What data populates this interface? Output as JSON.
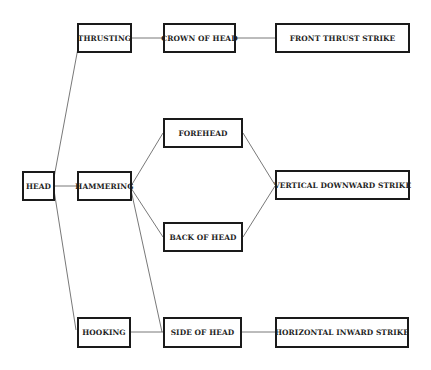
{
  "diagram": {
    "type": "tree",
    "colors": {
      "line": "#555555",
      "border": "#1a1a1a",
      "text": "#1e1e1e",
      "background": "#ffffff"
    },
    "nodes": {
      "head": {
        "label": "HEAD",
        "x": 22,
        "y": 171,
        "w": 33,
        "h": 30
      },
      "thrusting": {
        "label": "THRUSTING",
        "x": 77,
        "y": 23,
        "w": 55,
        "h": 30
      },
      "hammering": {
        "label": "HAMMERING",
        "x": 77,
        "y": 171,
        "w": 55,
        "h": 30
      },
      "hooking": {
        "label": "HOOKING",
        "x": 77,
        "y": 317,
        "w": 54,
        "h": 31
      },
      "crown": {
        "label": "CROWN OF HEAD",
        "x": 163,
        "y": 23,
        "w": 73,
        "h": 30
      },
      "forehead": {
        "label": "FOREHEAD",
        "x": 163,
        "y": 118,
        "w": 80,
        "h": 30
      },
      "back": {
        "label": "BACK OF HEAD",
        "x": 163,
        "y": 222,
        "w": 80,
        "h": 30
      },
      "side": {
        "label": "SIDE OF HEAD",
        "x": 163,
        "y": 317,
        "w": 79,
        "h": 31
      },
      "front_strike": {
        "label": "FRONT THRUST STRIKE",
        "x": 275,
        "y": 23,
        "w": 135,
        "h": 30
      },
      "vert_strike": {
        "label": "VERTICAL DOWNWARD STRIKE",
        "x": 275,
        "y": 170,
        "w": 135,
        "h": 30
      },
      "horiz_strike": {
        "label": "HORIZONTAL INWARD STRIKE",
        "x": 275,
        "y": 317,
        "w": 134,
        "h": 31
      }
    },
    "edges": [
      {
        "from": "head",
        "to": "thrusting"
      },
      {
        "from": "head",
        "to": "hammering"
      },
      {
        "from": "head",
        "to": "hooking"
      },
      {
        "from": "thrusting",
        "to": "crown"
      },
      {
        "from": "hammering",
        "to": "forehead"
      },
      {
        "from": "hammering",
        "to": "back"
      },
      {
        "from": "hammering",
        "to": "side"
      },
      {
        "from": "hooking",
        "to": "side"
      },
      {
        "from": "crown",
        "to": "front_strike"
      },
      {
        "from": "forehead",
        "to": "vert_strike"
      },
      {
        "from": "back",
        "to": "vert_strike"
      },
      {
        "from": "side",
        "to": "horiz_strike"
      }
    ]
  }
}
